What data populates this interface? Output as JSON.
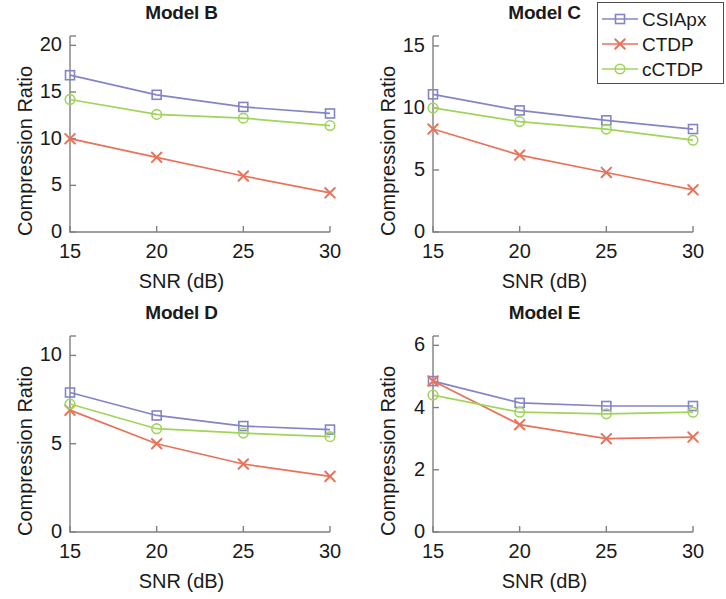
{
  "figure": {
    "width": 726,
    "height": 599,
    "background": "#ffffff"
  },
  "legend": {
    "position": "top-right",
    "border_color": "#4d4d4d",
    "entries": [
      {
        "label": "CSIApx",
        "color": "#8484c8",
        "marker": "square"
      },
      {
        "label": "CTDP",
        "color": "#e8735a",
        "marker": "cross"
      },
      {
        "label": "cCTDP",
        "color": "#a0d45a",
        "marker": "circle"
      }
    ]
  },
  "axis_labels": {
    "x": "SNR (dB)",
    "y": "Compression Ratio"
  },
  "chart_data": [
    {
      "type": "line",
      "title": "Model B",
      "xlabel": "SNR (dB)",
      "ylabel": "Compression Ratio",
      "x": [
        15,
        20,
        25,
        30
      ],
      "xticks": [
        15,
        20,
        25,
        30
      ],
      "xlim": [
        15,
        30
      ],
      "yticks": [
        0,
        5,
        10,
        15,
        20
      ],
      "ylim": [
        0,
        21
      ],
      "grid": false,
      "series": [
        {
          "name": "CSIApx",
          "color": "#8484c8",
          "marker": "square",
          "values": [
            16.8,
            14.7,
            13.4,
            12.7
          ]
        },
        {
          "name": "CTDP",
          "color": "#e8735a",
          "marker": "cross",
          "values": [
            10.0,
            8.0,
            6.0,
            4.2
          ]
        },
        {
          "name": "cCTDP",
          "color": "#a0d45a",
          "marker": "circle",
          "values": [
            14.2,
            12.6,
            12.2,
            11.4
          ]
        }
      ]
    },
    {
      "type": "line",
      "title": "Model C",
      "xlabel": "SNR (dB)",
      "ylabel": "Compression Ratio",
      "x": [
        15,
        20,
        25,
        30
      ],
      "xticks": [
        15,
        20,
        25,
        30
      ],
      "xlim": [
        15,
        30
      ],
      "yticks": [
        0,
        5,
        10,
        15
      ],
      "ylim": [
        0,
        15.8
      ],
      "grid": false,
      "series": [
        {
          "name": "CSIApx",
          "color": "#8484c8",
          "marker": "square",
          "values": [
            11.1,
            9.8,
            9.0,
            8.3
          ]
        },
        {
          "name": "CTDP",
          "color": "#e8735a",
          "marker": "cross",
          "values": [
            8.3,
            6.2,
            4.8,
            3.4
          ]
        },
        {
          "name": "cCTDP",
          "color": "#a0d45a",
          "marker": "circle",
          "values": [
            10.0,
            8.9,
            8.3,
            7.4
          ]
        }
      ]
    },
    {
      "type": "line",
      "title": "Model D",
      "xlabel": "SNR (dB)",
      "ylabel": "Compression Ratio",
      "x": [
        15,
        20,
        25,
        30
      ],
      "xticks": [
        15,
        20,
        25,
        30
      ],
      "xlim": [
        15,
        30
      ],
      "yticks": [
        0,
        5,
        10
      ],
      "ylim": [
        0,
        11.1
      ],
      "grid": false,
      "series": [
        {
          "name": "CSIApx",
          "color": "#8484c8",
          "marker": "square",
          "values": [
            7.9,
            6.6,
            6.0,
            5.8
          ]
        },
        {
          "name": "CTDP",
          "color": "#e8735a",
          "marker": "cross",
          "values": [
            6.9,
            5.0,
            3.85,
            3.15
          ]
        },
        {
          "name": "cCTDP",
          "color": "#a0d45a",
          "marker": "circle",
          "values": [
            7.25,
            5.85,
            5.6,
            5.4
          ]
        }
      ]
    },
    {
      "type": "line",
      "title": "Model E",
      "xlabel": "SNR (dB)",
      "ylabel": "Compression Ratio",
      "x": [
        15,
        20,
        25,
        30
      ],
      "xticks": [
        15,
        20,
        25,
        30
      ],
      "xlim": [
        15,
        30
      ],
      "yticks": [
        0,
        2,
        4,
        6
      ],
      "ylim": [
        0,
        6.3
      ],
      "grid": false,
      "series": [
        {
          "name": "CSIApx",
          "color": "#8484c8",
          "marker": "square",
          "values": [
            4.85,
            4.15,
            4.05,
            4.05
          ]
        },
        {
          "name": "CTDP",
          "color": "#e8735a",
          "marker": "cross",
          "values": [
            4.85,
            3.45,
            3.0,
            3.05
          ]
        },
        {
          "name": "cCTDP",
          "color": "#a0d45a",
          "marker": "circle",
          "values": [
            4.4,
            3.85,
            3.8,
            3.85
          ]
        }
      ]
    }
  ]
}
